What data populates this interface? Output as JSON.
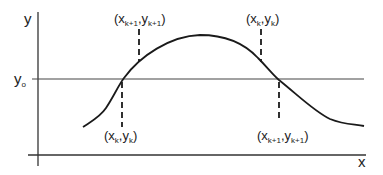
{
  "diagram": {
    "axes": {
      "x_label": "x",
      "y_label": "y",
      "reference_line_label": "y",
      "reference_line_subscript": "o"
    },
    "points": [
      {
        "id": "upper-left",
        "open": "(x",
        "xs": "k+1",
        "comma": ",y",
        "ys": "k+1",
        "close": ")"
      },
      {
        "id": "upper-right",
        "open": "(x",
        "xs": "k",
        "comma": ",y",
        "ys": "k",
        "close": ")"
      },
      {
        "id": "lower-left",
        "open": "(x",
        "xs": "k",
        "comma": ",y",
        "ys": "k",
        "close": ")"
      },
      {
        "id": "lower-right",
        "open": "(x",
        "xs": "k+1",
        "comma": ",y",
        "ys": "k+1",
        "close": ")"
      }
    ],
    "colors": {
      "line": "#1a1a1a",
      "axis": "#333333",
      "reference": "#444444"
    }
  }
}
